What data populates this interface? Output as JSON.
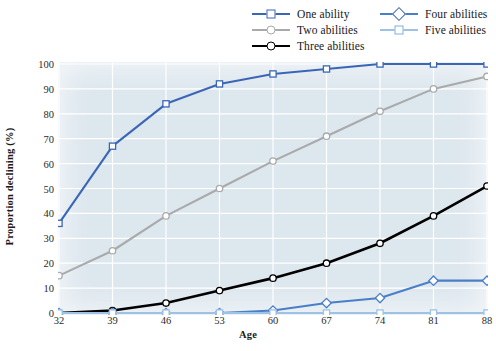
{
  "chart_data": {
    "type": "line",
    "title": "",
    "xlabel": "Age",
    "ylabel": "Proportion declining (%)",
    "x": [
      32,
      39,
      46,
      53,
      60,
      67,
      74,
      81,
      88
    ],
    "categories": [
      "32",
      "39",
      "46",
      "53",
      "60",
      "67",
      "74",
      "81",
      "88"
    ],
    "xlim": [
      32,
      88
    ],
    "ylim": [
      0,
      100
    ],
    "yticks": [
      0,
      10,
      20,
      30,
      40,
      50,
      60,
      70,
      80,
      90,
      100
    ],
    "ytick_labels": [
      "0",
      "10",
      "20",
      "30",
      "40",
      "50",
      "60",
      "70",
      "80",
      "90",
      "100"
    ],
    "grid": true,
    "legend_position": "top",
    "series": [
      {
        "name": "One ability",
        "values": [
          36,
          67,
          84,
          92,
          96,
          98,
          100,
          100,
          100
        ],
        "color": "#3b66b5",
        "marker": "square"
      },
      {
        "name": "Two abilities",
        "values": [
          15,
          25,
          39,
          50,
          61,
          71,
          81,
          90,
          95
        ],
        "color": "#a8aaab",
        "marker": "circle"
      },
      {
        "name": "Three abilities",
        "values": [
          0,
          1,
          4,
          9,
          14,
          20,
          28,
          39,
          51
        ],
        "color": "#000000",
        "marker": "circle"
      },
      {
        "name": "Four abilities",
        "values": [
          0,
          0,
          0,
          0,
          1,
          4,
          6,
          13,
          13
        ],
        "color": "#4a7fc8",
        "marker": "diamond"
      },
      {
        "name": "Five abilities",
        "values": [
          0,
          0,
          0,
          0,
          0,
          0,
          0,
          0,
          0
        ],
        "color": "#9ec2e4",
        "marker": "square"
      }
    ]
  },
  "legend": {
    "items": [
      {
        "label": "One ability"
      },
      {
        "label": "Two abilities"
      },
      {
        "label": "Three abilities"
      },
      {
        "label": "Four abilities"
      },
      {
        "label": "Five abilities"
      }
    ]
  }
}
